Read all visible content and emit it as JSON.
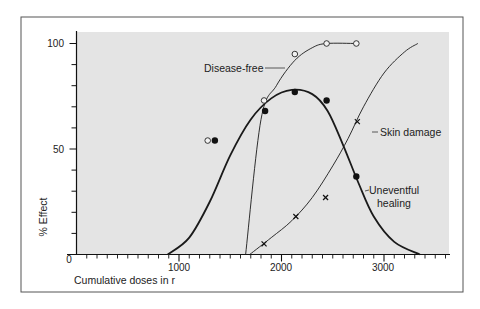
{
  "chart_data": {
    "type": "line",
    "title": "",
    "xlabel": "Cumulative doses in r",
    "ylabel": "% Effect",
    "xlim": [
      0,
      3650
    ],
    "ylim": [
      0,
      100
    ],
    "x_ticks": [
      0,
      1000,
      2000,
      3000
    ],
    "x_tick_labels": [
      "0",
      "1000",
      "2000",
      "3000"
    ],
    "x_minor_tick_step": 100,
    "y_ticks": [
      0,
      50,
      100
    ],
    "y_tick_labels": [
      "0",
      "50",
      "100"
    ],
    "y_minor_tick_step": 10,
    "grid": false,
    "legend": "inline annotations",
    "plot_background": "#e4e4e4",
    "series": [
      {
        "name": "Disease-free",
        "marker": "open-circle",
        "points": [
          {
            "x": 1280,
            "y": 54
          },
          {
            "x": 1830,
            "y": 73
          },
          {
            "x": 2130,
            "y": 95
          },
          {
            "x": 2440,
            "y": 100
          },
          {
            "x": 2730,
            "y": 100
          }
        ],
        "curve": [
          [
            1650,
            0
          ],
          [
            1800,
            64
          ],
          [
            1950,
            80
          ],
          [
            2130,
            92
          ],
          [
            2300,
            98
          ],
          [
            2440,
            100
          ],
          [
            2730,
            100
          ]
        ]
      },
      {
        "name": "Uneventful healing",
        "marker": "filled-circle",
        "points": [
          {
            "x": 1350,
            "y": 54
          },
          {
            "x": 1840,
            "y": 68
          },
          {
            "x": 2130,
            "y": 77
          },
          {
            "x": 2440,
            "y": 73
          },
          {
            "x": 2730,
            "y": 37
          }
        ],
        "curve": [
          [
            890,
            0
          ],
          [
            1100,
            8
          ],
          [
            1300,
            25
          ],
          [
            1500,
            47
          ],
          [
            1700,
            64
          ],
          [
            1900,
            74
          ],
          [
            2100,
            78
          ],
          [
            2300,
            76
          ],
          [
            2450,
            68
          ],
          [
            2600,
            52
          ],
          [
            2750,
            34
          ],
          [
            2900,
            18
          ],
          [
            3100,
            6
          ],
          [
            3350,
            0
          ]
        ]
      },
      {
        "name": "Skin damage",
        "marker": "x",
        "points": [
          {
            "x": 1830,
            "y": 5
          },
          {
            "x": 2140,
            "y": 18
          },
          {
            "x": 2430,
            "y": 27
          },
          {
            "x": 2740,
            "y": 63
          }
        ],
        "curve": [
          [
            1690,
            0
          ],
          [
            1900,
            8
          ],
          [
            2100,
            16
          ],
          [
            2300,
            27
          ],
          [
            2500,
            42
          ],
          [
            2650,
            55
          ],
          [
            2800,
            70
          ],
          [
            3000,
            86
          ],
          [
            3200,
            96
          ],
          [
            3330,
            100
          ]
        ]
      }
    ],
    "annotations": [
      {
        "text": "Disease-free",
        "target_series": "Disease-free"
      },
      {
        "text": "Skin damage",
        "target_series": "Skin damage"
      },
      {
        "text": "Uneventful",
        "target_series": "Uneventful healing"
      },
      {
        "text": "healing",
        "target_series": "Uneventful healing"
      }
    ]
  },
  "labels": {
    "y_axis_title": "% Effect",
    "x_axis_title": "Cumulative doses in r",
    "x_tick_0": "0",
    "x_tick_1000": "1000",
    "x_tick_2000": "2000",
    "x_tick_3000": "3000",
    "y_tick_50": "50",
    "y_tick_100": "100",
    "annot_disease_free": "Disease-free",
    "annot_skin_damage": "Skin damage",
    "annot_uneventful": "Uneventful",
    "annot_healing": "healing"
  }
}
